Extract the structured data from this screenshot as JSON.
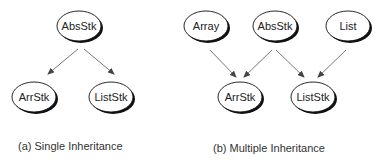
{
  "panels": [
    {
      "caption": "(a) Single Inheritance",
      "nodes": [
        {
          "id": "AbsStk",
          "label": "AbsStk"
        },
        {
          "id": "ArrStk",
          "label": "ArrStk"
        },
        {
          "id": "ListStk",
          "label": "ListStk"
        }
      ],
      "edges": [
        {
          "from": "AbsStk",
          "to": "ArrStk"
        },
        {
          "from": "AbsStk",
          "to": "ListStk"
        }
      ]
    },
    {
      "caption": "(b) Multiple Inheritance",
      "nodes": [
        {
          "id": "Array",
          "label": "Array"
        },
        {
          "id": "AbsStk",
          "label": "AbsStk"
        },
        {
          "id": "List",
          "label": "List"
        },
        {
          "id": "ArrStk",
          "label": "ArrStk"
        },
        {
          "id": "ListStk",
          "label": "ListStk"
        }
      ],
      "edges": [
        {
          "from": "Array",
          "to": "ArrStk"
        },
        {
          "from": "AbsStk",
          "to": "ArrStk"
        },
        {
          "from": "AbsStk",
          "to": "ListStk"
        },
        {
          "from": "List",
          "to": "ListStk"
        }
      ]
    }
  ]
}
